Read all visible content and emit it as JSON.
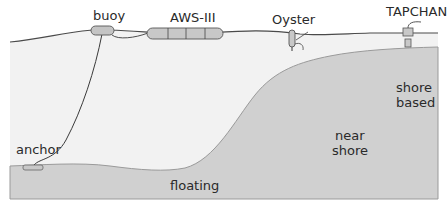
{
  "diagram": {
    "labels": {
      "buoy": "buoy",
      "aws": "AWS-III",
      "oyster": "Oyster",
      "tapchan": "TAPCHAN",
      "anchor": "anchor",
      "floating": "floating",
      "near_shore_line1": "near",
      "near_shore_line2": "shore",
      "shore_based_line1": "shore",
      "shore_based_line2": "based"
    },
    "colors": {
      "sea": "#f1f1f1",
      "seabed": "#cfcfcf",
      "seabed_edge": "#9a9a9a",
      "device_fill": "#c8c8c8",
      "line": "#3a3a3a"
    }
  },
  "caption": {
    "partial_text": ""
  }
}
